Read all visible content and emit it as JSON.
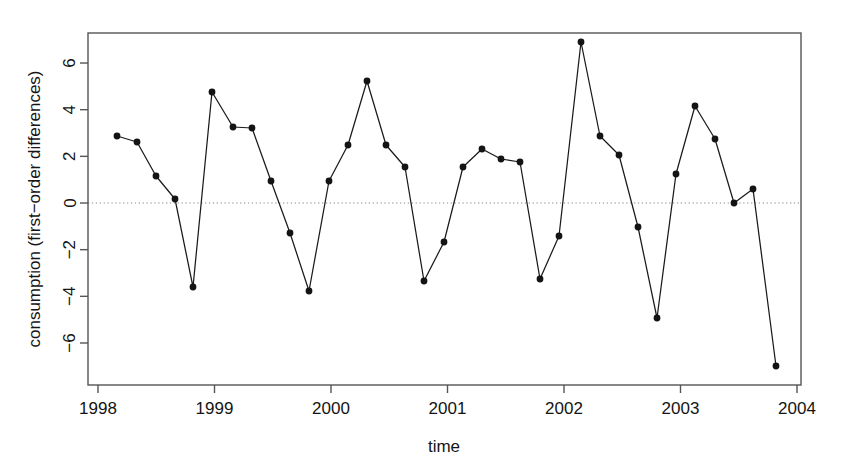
{
  "chart_data": {
    "type": "line",
    "title": "",
    "subtitle": "",
    "xlabel": "time",
    "ylabel": "consumption (first-order differences)",
    "xlim": [
      1997.9,
      2004.05
    ],
    "ylim": [
      -7.9,
      8.1
    ],
    "grid": false,
    "legend": null,
    "zero_reference_line": 0,
    "zero_line_style": "dotted",
    "marker": "filled-circle",
    "line_color": "#1a1a1a",
    "marker_color": "#141414",
    "xticks": [
      1998,
      1999,
      2000,
      2001,
      2002,
      2003,
      2004
    ],
    "xtick_labels": [
      "1998",
      "1999",
      "2000",
      "2001",
      "2002",
      "2003",
      "2004"
    ],
    "yticks": [
      -6,
      -4,
      -2,
      0,
      2,
      4,
      6
    ],
    "ytick_labels": [
      "-6",
      "-4",
      "-2",
      "0",
      "2",
      "4",
      "6"
    ],
    "x": [
      1998.0,
      1998.25,
      1998.5,
      1998.75,
      1999.0,
      1999.25,
      1999.5,
      1999.75,
      2000.0,
      2000.25,
      2000.5,
      2000.75,
      2001.0,
      2001.25,
      2001.5,
      2001.75,
      2002.0,
      2002.25,
      2002.5,
      2002.75,
      2003.0,
      2003.25,
      2003.5,
      2003.75
    ],
    "values": [
      2.87,
      2.6,
      1.15,
      0.18,
      -3.6,
      4.78,
      3.25,
      3.2,
      0.85,
      -1.3,
      -3.75,
      0.85,
      2.5,
      5.2,
      2.5,
      1.55,
      -3.35,
      -1.7,
      1.55,
      2.3,
      1.9,
      1.75,
      -3.25,
      -1.4
    ],
    "series": [
      {
        "name": "consumption (first-order differences)",
        "points": [
          {
            "x": 1998.0,
            "y": 2.87
          },
          {
            "x": 1998.25,
            "y": 2.6
          },
          {
            "x": 1998.5,
            "y": 1.15
          },
          {
            "x": 1998.75,
            "y": 0.18
          },
          {
            "x": 1999.0,
            "y": -3.6
          },
          {
            "x": 1999.1,
            "y": 4.78
          },
          {
            "x": 1999.25,
            "y": 3.25
          },
          {
            "x": 1999.5,
            "y": 3.2
          },
          {
            "x": 1999.75,
            "y": 0.85
          },
          {
            "x": 2000.0,
            "y": -1.3
          },
          {
            "x": 2000.1,
            "y": -3.75
          },
          {
            "x": 2000.25,
            "y": 0.85
          },
          {
            "x": 2000.5,
            "y": 2.5
          },
          {
            "x": 2000.75,
            "y": 5.2
          },
          {
            "x": 2001.0,
            "y": 2.5
          },
          {
            "x": 2001.1,
            "y": 1.55
          },
          {
            "x": 2001.25,
            "y": -3.35
          },
          {
            "x": 2001.5,
            "y": -1.7
          },
          {
            "x": 2001.75,
            "y": 2.3
          },
          {
            "x": 2002.0,
            "y": 1.9
          },
          {
            "x": 2002.1,
            "y": 1.75
          },
          {
            "x": 2002.25,
            "y": -3.25
          },
          {
            "x": 2002.5,
            "y": -1.4
          },
          {
            "x": 2002.75,
            "y": 6.95
          }
        ]
      }
    ],
    "pixel_series": [
      {
        "px": 117,
        "py": 136,
        "t": 1998.02,
        "v": 2.87
      },
      {
        "px": 137,
        "py": 142,
        "t": 1998.19,
        "v": 2.6
      },
      {
        "px": 156,
        "py": 176,
        "t": 1998.35,
        "v": 1.15
      },
      {
        "px": 175,
        "py": 199,
        "t": 1998.51,
        "v": 0.18
      },
      {
        "px": 193,
        "py": 287,
        "t": 1998.66,
        "v": -3.6
      },
      {
        "px": 212,
        "py": 92,
        "t": 1998.82,
        "v": 4.78
      },
      {
        "px": 233,
        "py": 127,
        "t": 1999.0,
        "v": 3.25
      },
      {
        "px": 252,
        "py": 128,
        "t": 1999.16,
        "v": 3.2
      },
      {
        "px": 271,
        "py": 181,
        "t": 1999.32,
        "v": 0.85
      },
      {
        "px": 290,
        "py": 233,
        "t": 1999.48,
        "v": -1.3
      },
      {
        "px": 309,
        "py": 291,
        "t": 1999.64,
        "v": -3.75
      },
      {
        "px": 329,
        "py": 181,
        "t": 1999.81,
        "v": 0.85
      },
      {
        "px": 348,
        "py": 145,
        "t": 1999.97,
        "v": 2.5
      },
      {
        "px": 367,
        "py": 81,
        "t": 2000.13,
        "v": 5.2
      },
      {
        "px": 386,
        "py": 145,
        "t": 2000.29,
        "v": 2.5
      },
      {
        "px": 405,
        "py": 167,
        "t": 2000.45,
        "v": 1.55
      },
      {
        "px": 424,
        "py": 281,
        "t": 2000.62,
        "v": -3.35
      },
      {
        "px": 444,
        "py": 242,
        "t": 2000.78,
        "v": -1.7
      },
      {
        "px": 463,
        "py": 167,
        "t": 2000.94,
        "v": 1.55
      },
      {
        "px": 482,
        "py": 149,
        "t": 2001.1,
        "v": 2.3
      },
      {
        "px": 501,
        "py": 159,
        "t": 2001.26,
        "v": 1.9
      },
      {
        "px": 520,
        "py": 162,
        "t": 2001.42,
        "v": 1.75
      },
      {
        "px": 540,
        "py": 279,
        "t": 2001.59,
        "v": -3.25
      },
      {
        "px": 559,
        "py": 236,
        "t": 2001.75,
        "v": -1.4
      },
      {
        "px": 581,
        "py": 42,
        "t": 2001.94,
        "v": 6.95
      },
      {
        "px": 600,
        "py": 136,
        "t": 2002.1,
        "v": 2.85
      },
      {
        "px": 619,
        "py": 155,
        "t": 2002.26,
        "v": 2.05
      },
      {
        "px": 638,
        "py": 227,
        "t": 2002.42,
        "v": -1.05
      },
      {
        "px": 657,
        "py": 318,
        "t": 2002.58,
        "v": -4.9
      },
      {
        "px": 676,
        "py": 174,
        "t": 2002.74,
        "v": 1.25
      },
      {
        "px": 695,
        "py": 106,
        "t": 2002.9,
        "v": 4.2
      },
      {
        "px": 715,
        "py": 139,
        "t": 2003.07,
        "v": 2.75
      },
      {
        "px": 734,
        "py": 203,
        "t": 2003.23,
        "v": 0.0
      },
      {
        "px": 753,
        "py": 189,
        "t": 2003.39,
        "v": 0.6
      },
      {
        "px": 776,
        "py": 366,
        "t": 2003.59,
        "v": -7.0
      }
    ]
  },
  "axes": {
    "x_axis_title": "time",
    "y_axis_title": "consumption (first−order differences)"
  },
  "figure": {
    "background": "#ffffff",
    "foreground": "#1a1a1a",
    "zero_line_color": "#8c8c8c"
  }
}
